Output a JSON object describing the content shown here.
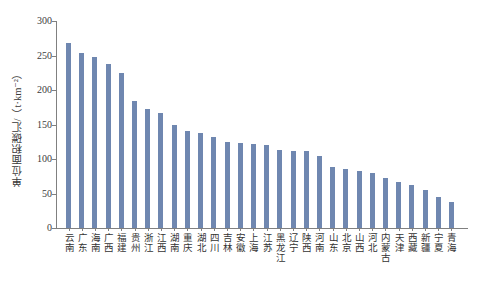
{
  "chart_data": {
    "type": "bar",
    "title": "",
    "subtitle": "",
    "xlabel": "",
    "ylabel": "单位面积碳汇/（t·km⁻²）",
    "ylim": [
      0,
      300
    ],
    "yticks": [
      0,
      50,
      100,
      150,
      200,
      250,
      300
    ],
    "ytick_labels": [
      "0",
      "50",
      "100",
      "150",
      "200",
      "250",
      "300"
    ],
    "grid": false,
    "legend": null,
    "legend_position": "none",
    "bar_color": "#6f87b0",
    "axis_color": "#808080",
    "categories": [
      "云南",
      "广东",
      "海南",
      "广西",
      "福建",
      "贵州",
      "浙江",
      "江西",
      "湖南",
      "重庆",
      "湖北",
      "四川",
      "吉林",
      "安徽",
      "上海",
      "江苏",
      "黑龙江",
      "辽宁",
      "陕西",
      "河南",
      "山东",
      "北京",
      "山西",
      "河北",
      "内蒙古",
      "天津",
      "西藏",
      "新疆",
      "宁夏",
      "青海"
    ],
    "values": [
      268,
      254,
      248,
      238,
      225,
      184,
      172,
      166,
      150,
      141,
      137,
      132,
      124,
      123,
      122,
      120,
      113,
      112,
      111,
      104,
      88,
      85,
      83,
      80,
      73,
      66,
      62,
      55,
      45,
      37
    ]
  }
}
